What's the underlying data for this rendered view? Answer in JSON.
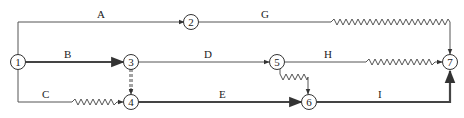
{
  "diagram": {
    "type": "time-scaled network (double-code)",
    "nodes": [
      {
        "id": "1",
        "label": "1"
      },
      {
        "id": "2",
        "label": "2"
      },
      {
        "id": "3",
        "label": "3"
      },
      {
        "id": "4",
        "label": "4"
      },
      {
        "id": "5",
        "label": "5"
      },
      {
        "id": "6",
        "label": "6"
      },
      {
        "id": "7",
        "label": "7"
      }
    ],
    "activities": [
      {
        "label": "A",
        "from": "1",
        "to": "2"
      },
      {
        "label": "B",
        "from": "1",
        "to": "3",
        "critical": true
      },
      {
        "label": "C",
        "from": "1",
        "to": "4",
        "free_float": true
      },
      {
        "label": "D",
        "from": "3",
        "to": "5"
      },
      {
        "label": "E",
        "from": "4",
        "to": "6",
        "critical": true
      },
      {
        "label": "G",
        "from": "2",
        "to": "7",
        "free_float": true
      },
      {
        "label": "H",
        "from": "5",
        "to": "7",
        "free_float": true
      },
      {
        "label": "I",
        "from": "6",
        "to": "7",
        "critical": true
      }
    ],
    "dummies": [
      {
        "from": "3",
        "to": "4",
        "critical": true
      },
      {
        "from": "5",
        "to": "6",
        "free_float": true
      }
    ]
  }
}
